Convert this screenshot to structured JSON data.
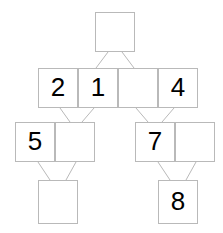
{
  "diagram": {
    "canvas": {
      "width": 223,
      "height": 233,
      "background": "#ffffff"
    },
    "style": {
      "node_border_color": "#b9b9b9",
      "node_fill_color": "#ffffff",
      "edge_color": "#b9b9b9",
      "label_color": "#000000",
      "node_width": 40,
      "node_height": 40
    },
    "nodes": [
      {
        "id": "n0",
        "label": "",
        "x": 95,
        "y": 12,
        "w": 40,
        "h": 40,
        "row": 1
      },
      {
        "id": "n1",
        "label": "2",
        "x": 38,
        "y": 68,
        "w": 40,
        "h": 40,
        "row": 2
      },
      {
        "id": "n2",
        "label": "1",
        "x": 78,
        "y": 68,
        "w": 40,
        "h": 40,
        "row": 2
      },
      {
        "id": "n3",
        "label": "",
        "x": 118,
        "y": 68,
        "w": 40,
        "h": 40,
        "row": 2
      },
      {
        "id": "n4",
        "label": "4",
        "x": 158,
        "y": 68,
        "w": 40,
        "h": 40,
        "row": 2
      },
      {
        "id": "n5",
        "label": "5",
        "x": 15,
        "y": 122,
        "w": 40,
        "h": 40,
        "row": 3
      },
      {
        "id": "n6",
        "label": "",
        "x": 55,
        "y": 122,
        "w": 40,
        "h": 40,
        "row": 3
      },
      {
        "id": "n7",
        "label": "7",
        "x": 135,
        "y": 122,
        "w": 40,
        "h": 40,
        "row": 3
      },
      {
        "id": "n8",
        "label": "",
        "x": 175,
        "y": 122,
        "w": 40,
        "h": 40,
        "row": 3
      },
      {
        "id": "n9",
        "label": "",
        "x": 38,
        "y": 180,
        "w": 40,
        "h": 44,
        "row": 4
      },
      {
        "id": "n10",
        "label": "8",
        "x": 158,
        "y": 180,
        "w": 40,
        "h": 44,
        "row": 4
      }
    ],
    "edges": [
      {
        "from": "n0",
        "to": "n2",
        "x1": 108,
        "y1": 52,
        "x2": 96,
        "y2": 68
      },
      {
        "from": "n0",
        "to": "n3",
        "x1": 122,
        "y1": 52,
        "x2": 134,
        "y2": 68
      },
      {
        "from": "n1",
        "to": "n6",
        "x1": 60,
        "y1": 108,
        "x2": 70,
        "y2": 122
      },
      {
        "from": "n2",
        "to": "n6",
        "x1": 94,
        "y1": 108,
        "x2": 82,
        "y2": 122
      },
      {
        "from": "n3",
        "to": "n7",
        "x1": 136,
        "y1": 108,
        "x2": 148,
        "y2": 122
      },
      {
        "from": "n4",
        "to": "n7",
        "x1": 174,
        "y1": 108,
        "x2": 162,
        "y2": 122
      },
      {
        "from": "n5",
        "to": "n9",
        "x1": 38,
        "y1": 162,
        "x2": 50,
        "y2": 180
      },
      {
        "from": "n6",
        "to": "n9",
        "x1": 76,
        "y1": 162,
        "x2": 66,
        "y2": 180
      },
      {
        "from": "n7",
        "to": "n10",
        "x1": 158,
        "y1": 162,
        "x2": 170,
        "y2": 180
      },
      {
        "from": "n8",
        "to": "n10",
        "x1": 196,
        "y1": 162,
        "x2": 186,
        "y2": 180
      }
    ]
  }
}
